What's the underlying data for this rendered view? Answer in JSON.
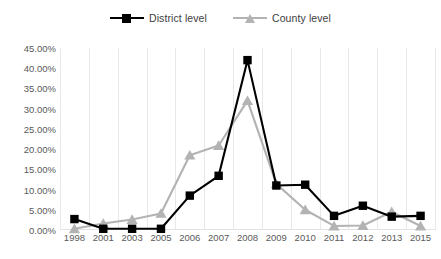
{
  "chart_data": {
    "type": "line",
    "title": "",
    "xlabel": "",
    "ylabel": "",
    "categories": [
      "1998",
      "2001",
      "2003",
      "2005",
      "2006",
      "2007",
      "2008",
      "2009",
      "2010",
      "2011",
      "2012",
      "2013",
      "2015"
    ],
    "ytick_labels": [
      "0.00%",
      "5.00%",
      "10.00%",
      "15.00%",
      "20.00%",
      "25.00%",
      "30.00%",
      "35.00%",
      "40.00%",
      "45.00%"
    ],
    "ytick_values": [
      0,
      5,
      10,
      15,
      20,
      25,
      30,
      35,
      40,
      45
    ],
    "ylim": [
      0,
      45
    ],
    "y_unit": "%",
    "grid": "vertical",
    "legend_position": "top-center",
    "series": [
      {
        "name": "District level",
        "color": "#000000",
        "marker": "square",
        "values": [
          2.7,
          0.3,
          0.3,
          0.3,
          8.5,
          13.4,
          42.0,
          11.0,
          11.2,
          3.5,
          6.0,
          3.3,
          3.5
        ]
      },
      {
        "name": "County level",
        "color": "#b3b3b3",
        "marker": "triangle",
        "values": [
          0.3,
          1.6,
          2.6,
          4.1,
          18.5,
          20.9,
          32.0,
          11.4,
          5.0,
          1.0,
          1.1,
          4.5,
          1.0
        ]
      }
    ]
  },
  "legend": {
    "entries": [
      {
        "label": "District level"
      },
      {
        "label": "County level"
      }
    ]
  },
  "colors": {
    "district": "#000000",
    "county": "#b3b3b3",
    "gridline": "#e8e8e8",
    "tick_text": "#5a5a5a",
    "legend_text": "#3d3d3d",
    "background": "#ffffff"
  }
}
